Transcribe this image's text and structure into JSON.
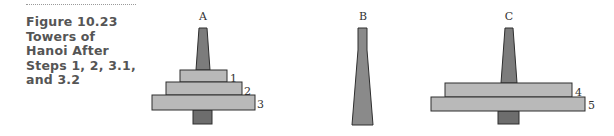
{
  "caption": {
    "lines": [
      "Figure 10.23",
      "Towers of",
      "Hanoi After",
      "Steps 1, 2, 3.1,",
      "and 3.2"
    ]
  },
  "colors": {
    "disk_fill": "#b9b9b9",
    "peg_fill": "#7c7c7c",
    "base_fill": "#6d6d6d",
    "outline": "#2e2e2e",
    "caption_text": "#555555"
  },
  "pegs": [
    {
      "label": "A",
      "disks": [
        "1",
        "2",
        "3"
      ]
    },
    {
      "label": "B",
      "disks": []
    },
    {
      "label": "C",
      "disks": [
        "4",
        "5"
      ]
    }
  ],
  "peg_labels": {
    "A": "A",
    "B": "B",
    "C": "C"
  },
  "disk_labels": {
    "d1": "1",
    "d2": "2",
    "d3": "3",
    "d4": "4",
    "d5": "5"
  }
}
